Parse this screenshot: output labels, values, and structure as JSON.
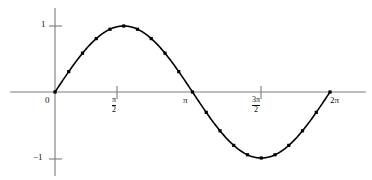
{
  "chart_data": {
    "type": "line",
    "title": "",
    "subtitle": "",
    "xlabel": "",
    "ylabel": "",
    "function": "y = sin(x)",
    "grid": false,
    "legend": null,
    "xlim": [
      0,
      6.283185307179586
    ],
    "ylim": [
      -1,
      1
    ],
    "x_tick_labels": [
      "0",
      "pi/2",
      "pi",
      "3pi/2",
      "2pi"
    ],
    "x_tick_values": [
      0,
      1.5707963,
      3.1415927,
      4.712389,
      6.2831853
    ],
    "y_tick_labels": [
      "1",
      "-1"
    ],
    "y_tick_values": [
      1,
      -1
    ],
    "marker": "square-dot",
    "x": [
      0,
      0.3141593,
      0.6283185,
      0.9424778,
      1.2566371,
      1.5707963,
      1.8849556,
      2.1991149,
      2.5132741,
      2.8274334,
      3.1415927,
      3.4557519,
      3.7699112,
      4.0840704,
      4.3982297,
      4.712389,
      5.0265482,
      5.3407075,
      5.6548668,
      5.969026,
      6.2831853
    ],
    "values": [
      0,
      0.309,
      0.5878,
      0.809,
      0.9511,
      1.0,
      0.9511,
      0.809,
      0.5878,
      0.309,
      0.0,
      -0.309,
      -0.5878,
      -0.809,
      -0.9511,
      -1.0,
      -0.9511,
      -0.809,
      -0.5878,
      -0.309,
      0.0
    ]
  },
  "labels": {
    "y_one": "1",
    "y_minus_one": "−1",
    "x_zero": "0",
    "x_pi_over_2_num": "π",
    "x_pi_over_2_den": "2",
    "x_pi": "π",
    "x_3pi_over_2_num": "3π",
    "x_3pi_over_2_den": "2",
    "x_2pi": "2π"
  },
  "colors": {
    "curve": "#000000",
    "axis": "#7c7c7c",
    "text": "#111111",
    "background": "#ffffff",
    "marker": "#000000"
  }
}
